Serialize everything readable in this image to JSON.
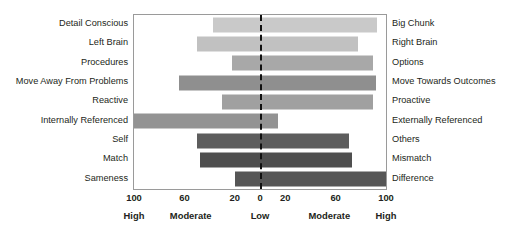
{
  "chart_data": {
    "type": "bar",
    "orientation": "horizontal-diverging",
    "title": "",
    "subtitle": "",
    "xlabel": "",
    "ylabel": "",
    "grid": false,
    "legend": false,
    "xlim": [
      -100,
      100
    ],
    "zero_line": 0,
    "axis": {
      "ticks": [
        {
          "label": "100",
          "value": -100
        },
        {
          "label": "60",
          "value": -60
        },
        {
          "label": "20",
          "value": -20
        },
        {
          "label": "0",
          "value": 0
        },
        {
          "label": "20",
          "value": 20
        },
        {
          "label": "60",
          "value": 60
        },
        {
          "label": "100",
          "value": 100
        }
      ],
      "bands": [
        {
          "label": "High",
          "value": -100
        },
        {
          "label": "Moderate",
          "value": -55
        },
        {
          "label": "Low",
          "value": 0
        },
        {
          "label": "Moderate",
          "value": 55
        },
        {
          "label": "High",
          "value": 100
        }
      ]
    },
    "categories": [
      "Detail Conscious / Big Chunk",
      "Left Brain / Right Brain",
      "Procedures / Options",
      "Move Away From Problems / Move Towards Outcomes",
      "Reactive / Proactive",
      "Internally Referenced / Externally Referenced",
      "Self / Others",
      "Match / Mismatch",
      "Sameness / Difference"
    ],
    "rows": [
      {
        "left_label": "Detail Conscious",
        "right_label": "Big Chunk",
        "left_value": 37,
        "right_value": 93,
        "color": "#c9c9c9"
      },
      {
        "left_label": "Left Brain",
        "right_label": "Right Brain",
        "left_value": 50,
        "right_value": 78,
        "color": "#c1c1c1"
      },
      {
        "left_label": "Procedures",
        "right_label": "Options",
        "left_value": 22,
        "right_value": 90,
        "color": "#a8a8a8"
      },
      {
        "left_label": "Move Away From Problems",
        "right_label": "Move Towards Outcomes",
        "left_value": 64,
        "right_value": 92,
        "color": "#8f8f8f"
      },
      {
        "left_label": "Reactive",
        "right_label": "Proactive",
        "left_value": 30,
        "right_value": 90,
        "color": "#a0a0a0"
      },
      {
        "left_label": "Internally Referenced",
        "right_label": "Externally Referenced",
        "left_value": 103,
        "right_value": 14,
        "color": "#939393"
      },
      {
        "left_label": "Self",
        "right_label": "Others",
        "left_value": 50,
        "right_value": 71,
        "color": "#5d5d5d"
      },
      {
        "left_label": "Match",
        "right_label": "Mismatch",
        "left_value": 48,
        "right_value": 73,
        "color": "#4f4f4f"
      },
      {
        "left_label": "Sameness",
        "right_label": "Difference",
        "left_value": 20,
        "right_value": 101,
        "color": "#565656"
      }
    ],
    "colors": {
      "background": "#ffffff",
      "frame": "#9a9a9a",
      "zero_line": "#111111",
      "text": "#231f20"
    }
  }
}
